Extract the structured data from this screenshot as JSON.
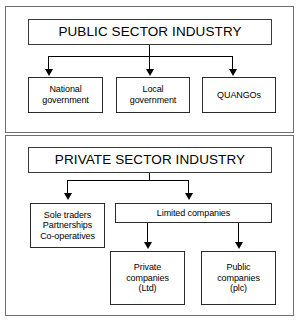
{
  "diagram": {
    "type": "hierarchy-flowchart",
    "panels": [
      {
        "id": "public-sector",
        "heading": "PUBLIC SECTOR INDUSTRY",
        "children": [
          {
            "id": "national-government",
            "lines": [
              "National",
              "government"
            ]
          },
          {
            "id": "local-government",
            "lines": [
              "Local",
              "government"
            ]
          },
          {
            "id": "quangos",
            "lines": [
              "QUANGOs"
            ]
          }
        ]
      },
      {
        "id": "private-sector",
        "heading": "PRIVATE SECTOR INDUSTRY",
        "children": [
          {
            "id": "unincorporated",
            "lines": [
              "Sole traders",
              "Partnerships",
              "Co-operatives"
            ]
          },
          {
            "id": "limited-companies",
            "lines": [
              "Limited companies"
            ]
          }
        ],
        "grandchildren": [
          {
            "id": "private-companies",
            "lines": [
              "Private",
              "companies",
              "(Ltd)"
            ]
          },
          {
            "id": "public-companies",
            "lines": [
              "Public",
              "companies",
              "(plc)"
            ]
          }
        ]
      }
    ]
  },
  "colors": {
    "background": "#ffffff",
    "box_border": "#2b2b2b",
    "panel_border": "#6e6e6e",
    "connector": "#000000",
    "text": "#000000"
  }
}
